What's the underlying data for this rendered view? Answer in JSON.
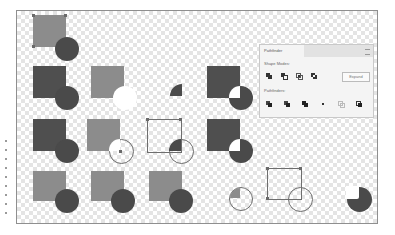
{
  "panel": {
    "title": "Pathfinder",
    "shape_modes_label": "Shape Modes:",
    "pathfinders_label": "Pathfinders:",
    "expand_label": "Expand",
    "shape_modes": [
      "unite-icon",
      "minus-front-icon",
      "intersect-icon",
      "exclude-icon"
    ],
    "pathfinders": [
      "divide-icon",
      "trim-icon",
      "merge-icon",
      "crop-icon",
      "outline-icon",
      "minus-back-icon"
    ]
  },
  "colors": {
    "light_fill": "#8c8c8c",
    "dark_fill": "#4f4f4f",
    "circle_fill": "#4a4a4a",
    "panel_bg": "#f4f4f4",
    "canvas_border": "#8f8f8f"
  }
}
